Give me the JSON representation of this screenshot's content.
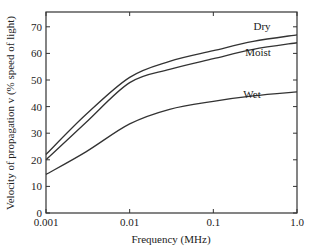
{
  "chart_data": {
    "type": "line",
    "title": "",
    "xlabel": "Frequency (MHz)",
    "ylabel": "Velocity of propagation v (% speed of light)",
    "xscale": "log",
    "xlim": [
      0.001,
      1.0
    ],
    "ylim": [
      0,
      75
    ],
    "x_ticks": [
      "0.001",
      "0.01",
      "0.1",
      "1.0"
    ],
    "y_ticks": [
      "0",
      "10",
      "20",
      "30",
      "40",
      "50",
      "60",
      "70"
    ],
    "grid": false,
    "legend": "inline labels",
    "x": [
      0.001,
      0.003,
      0.01,
      0.03,
      0.1,
      0.3,
      1.0
    ],
    "series": [
      {
        "name": "Dry",
        "values": [
          22,
          37,
          51,
          57,
          61,
          64.5,
          67
        ]
      },
      {
        "name": "Moist",
        "values": [
          20,
          34,
          49,
          54,
          58,
          61.5,
          64
        ]
      },
      {
        "name": "Wet",
        "values": [
          14.5,
          23,
          33.5,
          39,
          42,
          44,
          45.5
        ]
      }
    ]
  }
}
